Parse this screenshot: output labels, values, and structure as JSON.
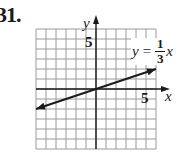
{
  "problem": {
    "number": "31."
  },
  "chart_data": {
    "type": "line",
    "title": "",
    "equation": {
      "lhs": "y",
      "equals": "=",
      "numerator": "1",
      "denominator": "3",
      "variable": "x"
    },
    "xlabel": "x",
    "ylabel": "y",
    "xlim": [
      -6,
      6
    ],
    "ylim": [
      -6,
      6
    ],
    "grid": true,
    "grid_step": 1,
    "tick_labels": {
      "x": [
        "5"
      ],
      "y": [
        "5"
      ]
    },
    "series": [
      {
        "name": "y = (1/3)x",
        "x": [
          -6,
          0,
          6
        ],
        "y": [
          -2,
          0,
          2
        ],
        "arrows": "both"
      }
    ]
  },
  "colors": {
    "grid": "#9a9a9a",
    "axis": "#1a1a1a",
    "line": "#1a1a1a",
    "background": "#ffffff"
  }
}
